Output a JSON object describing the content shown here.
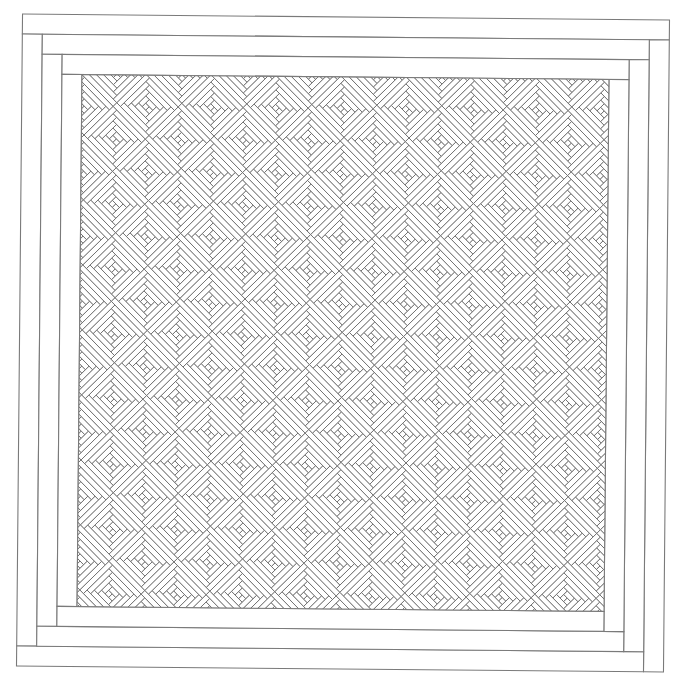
{
  "canvas": {
    "width": 686,
    "height": 679,
    "background": "#ffffff"
  },
  "style": {
    "border_stroke": "#7a7a7a",
    "border_stroke_width": 1.1,
    "pattern_stroke": "#6a6a6a",
    "pattern_stroke_width": 0.85,
    "fill": "#ffffff"
  },
  "quilt": {
    "rotation_deg": 0.53,
    "rotation_center": [
      343,
      343
    ],
    "origin": [
      19.5,
      17
    ],
    "width": 647,
    "height": 652,
    "border": {
      "rings": 3,
      "strip_width": 20,
      "layout": "top-full, left-between, bottom-to-right-strip, right-full-down"
    },
    "center_panel": {
      "inset": 60,
      "block_type": "log-cabin",
      "block_orientation": "diamond (45deg)",
      "block_half_diagonal": 32.5,
      "center_offset": [
        -1,
        -1
      ],
      "rings_per_block": 4,
      "lattice_columns": 17,
      "lattice_rows": 17,
      "lattice_parity": "odd"
    }
  }
}
